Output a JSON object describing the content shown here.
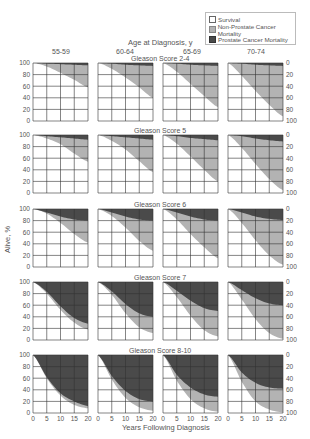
{
  "legend": {
    "items": [
      {
        "label": "Survival",
        "color": "#ffffff"
      },
      {
        "label": "Non-Prostate Cancer Mortality",
        "color": "#b3b3b3"
      },
      {
        "label": "Prostate Cancer Mortality",
        "color": "#4a4a4a"
      }
    ]
  },
  "header": {
    "title": "Age at Diagnosis, y",
    "age_groups": [
      "55-59",
      "60-64",
      "65-69",
      "70-74"
    ]
  },
  "row_titles": [
    "Gleason Score 2-4",
    "Gleason Score 5",
    "Gleason Score 6",
    "Gleason Score 7",
    "Gleason Score 8-10"
  ],
  "axes": {
    "left_label": "Alive, %",
    "bottom_label": "Years Following Diagnosis",
    "left_ticks": [
      "100",
      "80",
      "60",
      "40",
      "20",
      "0"
    ],
    "right_ticks": [
      "0",
      "20",
      "40",
      "60",
      "80",
      "100"
    ],
    "x_ticks": [
      "0",
      "5",
      "10",
      "15",
      "20"
    ]
  },
  "chart_data": {
    "type": "area",
    "xlabel": "Years Following Diagnosis",
    "ylabel": "Alive, %",
    "ylabel_right": "Cumulative mortality, %",
    "x": [
      0,
      5,
      10,
      15,
      20
    ],
    "xlim": [
      0,
      20
    ],
    "ylim": [
      0,
      100
    ],
    "grid": true,
    "legend_position": "top-right",
    "rows": [
      "Gleason Score 2-4",
      "Gleason Score 5",
      "Gleason Score 6",
      "Gleason Score 7",
      "Gleason Score 8-10"
    ],
    "columns": [
      "55-59",
      "60-64",
      "65-69",
      "70-74"
    ],
    "panels": [
      [
        {
          "alive": [
            100,
            94,
            83,
            71,
            58
          ],
          "pcm": [
            0,
            1,
            2,
            3,
            4
          ]
        },
        {
          "alive": [
            100,
            90,
            75,
            58,
            40
          ],
          "pcm": [
            0,
            1,
            3,
            4,
            5
          ]
        },
        {
          "alive": [
            100,
            85,
            64,
            43,
            24
          ],
          "pcm": [
            0,
            1,
            3,
            4,
            5
          ]
        },
        {
          "alive": [
            100,
            78,
            52,
            28,
            8
          ],
          "pcm": [
            0,
            1,
            3,
            4,
            5
          ]
        }
      ],
      [
        {
          "alive": [
            100,
            94,
            84,
            68,
            54
          ],
          "pcm": [
            0,
            2,
            4,
            6,
            8
          ]
        },
        {
          "alive": [
            100,
            90,
            75,
            55,
            36
          ],
          "pcm": [
            0,
            2,
            4,
            6,
            8
          ]
        },
        {
          "alive": [
            100,
            85,
            63,
            40,
            20
          ],
          "pcm": [
            0,
            2,
            5,
            7,
            9
          ]
        },
        {
          "alive": [
            100,
            78,
            50,
            24,
            5
          ],
          "pcm": [
            0,
            2,
            6,
            9,
            11
          ]
        }
      ],
      [
        {
          "alive": [
            100,
            92,
            76,
            57,
            42
          ],
          "pcm": [
            0,
            6,
            13,
            18,
            20
          ]
        },
        {
          "alive": [
            100,
            88,
            68,
            45,
            28
          ],
          "pcm": [
            0,
            6,
            13,
            18,
            20
          ]
        },
        {
          "alive": [
            100,
            82,
            57,
            34,
            15
          ],
          "pcm": [
            0,
            6,
            13,
            18,
            20
          ]
        },
        {
          "alive": [
            100,
            76,
            46,
            20,
            4
          ],
          "pcm": [
            0,
            6,
            13,
            17,
            19
          ]
        }
      ],
      [
        {
          "alive": [
            100,
            80,
            52,
            30,
            18
          ],
          "pcm": [
            0,
            17,
            42,
            62,
            72
          ]
        },
        {
          "alive": [
            100,
            78,
            46,
            22,
            12
          ],
          "pcm": [
            0,
            16,
            38,
            54,
            60
          ]
        },
        {
          "alive": [
            100,
            74,
            42,
            17,
            6
          ],
          "pcm": [
            0,
            15,
            32,
            45,
            50
          ]
        },
        {
          "alive": [
            100,
            70,
            36,
            12,
            2
          ],
          "pcm": [
            0,
            14,
            28,
            37,
            40
          ]
        }
      ],
      [
        {
          "alive": [
            100,
            60,
            30,
            14,
            8
          ],
          "pcm": [
            0,
            38,
            66,
            80,
            88
          ]
        },
        {
          "alive": [
            100,
            58,
            26,
            10,
            4
          ],
          "pcm": [
            0,
            36,
            62,
            76,
            80
          ]
        },
        {
          "alive": [
            100,
            56,
            24,
            8,
            2
          ],
          "pcm": [
            0,
            34,
            56,
            68,
            72
          ]
        },
        {
          "alive": [
            100,
            54,
            20,
            6,
            1
          ],
          "pcm": [
            0,
            30,
            48,
            56,
            58
          ]
        }
      ]
    ]
  }
}
